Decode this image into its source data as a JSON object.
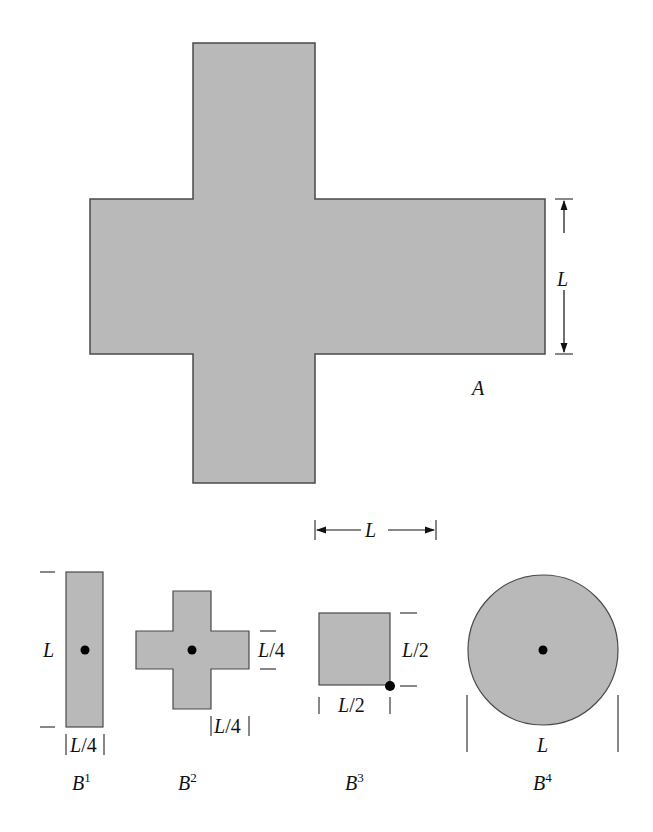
{
  "colors": {
    "shape_fill": "#b9b9b9",
    "shape_stroke": "#4a4a4a",
    "ink": "#111111",
    "background": "#ffffff"
  },
  "figure_A": {
    "label": "A",
    "dimension_vertical": "L",
    "dimension_horizontal": "L"
  },
  "figure_B1": {
    "label": "B",
    "superscript": "1",
    "height_label": "L",
    "width_label": "|L/4|"
  },
  "figure_B2": {
    "label": "B",
    "superscript": "2",
    "arm_height_label": "L/4",
    "arm_width_label": "|L/4|"
  },
  "figure_B3": {
    "label": "B",
    "superscript": "3",
    "height_label": "L/2",
    "width_label": "L/2"
  },
  "figure_B4": {
    "label": "B",
    "superscript": "4",
    "diameter_label": "L"
  }
}
